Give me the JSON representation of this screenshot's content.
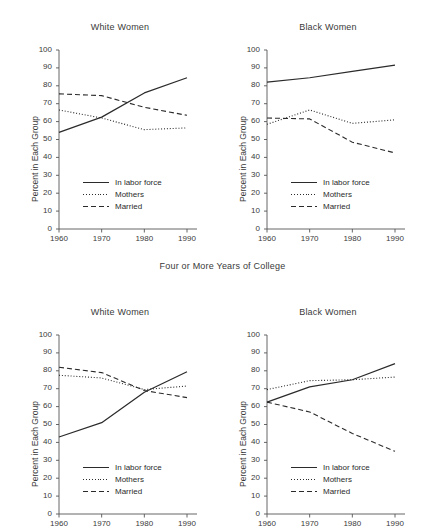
{
  "figure": {
    "group_label_top": "Four or More Years of College",
    "series_styles": {
      "in_labor_force": "solid",
      "mothers": "dotted",
      "married": "dashed"
    },
    "line_color": "#2b2b2b",
    "axis_color": "#555555"
  },
  "axes": {
    "ylabel": "Percent in Each Group",
    "yticks": [
      "100",
      "90",
      "80",
      "70",
      "60",
      "50",
      "40",
      "30",
      "20",
      "10",
      "0"
    ],
    "xticks": [
      "1960",
      "1970",
      "1980",
      "1990"
    ],
    "ylim": [
      0,
      100
    ],
    "xlim": [
      1960,
      1990
    ]
  },
  "legend": {
    "items": [
      {
        "label": "In labor force",
        "style": "solid"
      },
      {
        "label": "Mothers",
        "style": "dotted"
      },
      {
        "label": "Married",
        "style": "dashed"
      }
    ]
  },
  "chart_data": [
    {
      "type": "line",
      "panel": "top-left",
      "title": "White Women",
      "group": "Four or More Years of College",
      "xlabel": "",
      "ylabel": "Percent in Each Group",
      "x": [
        1960,
        1970,
        1980,
        1990
      ],
      "xlim": [
        1960,
        1990
      ],
      "ylim": [
        0,
        100
      ],
      "grid": false,
      "legend_position": "lower-left-inside",
      "series": [
        {
          "name": "In labor force",
          "style": "solid",
          "values": [
            54.0,
            62.5,
            76.0,
            84.5
          ]
        },
        {
          "name": "Mothers",
          "style": "dotted",
          "values": [
            66.5,
            62.0,
            55.5,
            56.5
          ]
        },
        {
          "name": "Married",
          "style": "dashed",
          "values": [
            75.5,
            74.5,
            68.0,
            63.5
          ]
        }
      ]
    },
    {
      "type": "line",
      "panel": "top-right",
      "title": "Black Women",
      "group": "Four or More Years of College",
      "xlabel": "",
      "ylabel": "Percent in Each Group",
      "x": [
        1960,
        1970,
        1980,
        1990
      ],
      "xlim": [
        1960,
        1990
      ],
      "ylim": [
        0,
        100
      ],
      "grid": false,
      "legend_position": "lower-left-inside",
      "series": [
        {
          "name": "In labor force",
          "style": "solid",
          "values": [
            82.0,
            84.5,
            88.0,
            91.5
          ]
        },
        {
          "name": "Mothers",
          "style": "dotted",
          "values": [
            58.5,
            66.5,
            59.0,
            61.0
          ]
        },
        {
          "name": "Married",
          "style": "dashed",
          "values": [
            62.0,
            61.5,
            48.5,
            42.5
          ]
        }
      ]
    },
    {
      "type": "line",
      "panel": "bottom-left",
      "title": "White Women",
      "group": "",
      "xlabel": "",
      "ylabel": "Percent in Each Group",
      "x": [
        1960,
        1970,
        1980,
        1990
      ],
      "xlim": [
        1960,
        1990
      ],
      "ylim": [
        0,
        100
      ],
      "grid": false,
      "legend_position": "lower-left-inside",
      "cropped": true,
      "series": [
        {
          "name": "In labor force",
          "style": "solid",
          "values": [
            43.0,
            51.0,
            68.0,
            79.5
          ]
        },
        {
          "name": "Mothers",
          "style": "dotted",
          "values": [
            77.5,
            76.0,
            69.5,
            71.5
          ]
        },
        {
          "name": "Married",
          "style": "dashed",
          "values": [
            82.0,
            79.0,
            69.0,
            65.0
          ]
        }
      ]
    },
    {
      "type": "line",
      "panel": "bottom-right",
      "title": "Black Women",
      "group": "",
      "xlabel": "",
      "ylabel": "Percent in Each Group",
      "x": [
        1960,
        1970,
        1980,
        1990
      ],
      "xlim": [
        1960,
        1990
      ],
      "ylim": [
        0,
        100
      ],
      "grid": false,
      "legend_position": "lower-left-inside",
      "cropped": true,
      "series": [
        {
          "name": "In labor force",
          "style": "solid",
          "values": [
            62.5,
            71.0,
            75.0,
            84.0
          ]
        },
        {
          "name": "Mothers",
          "style": "dotted",
          "values": [
            69.5,
            74.5,
            75.0,
            76.5
          ]
        },
        {
          "name": "Married",
          "style": "dashed",
          "values": [
            62.5,
            57.0,
            45.0,
            35.0
          ]
        }
      ]
    }
  ],
  "panels": {
    "top_left": {
      "title": "White Women"
    },
    "top_right": {
      "title": "Black Women"
    },
    "bottom_left": {
      "title": "White Women"
    },
    "bottom_right": {
      "title": "Black Women"
    }
  }
}
